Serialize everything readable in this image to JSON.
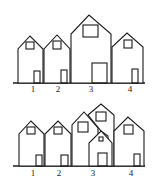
{
  "diagrams": [
    {
      "name": "top-row",
      "labels": [
        "1",
        "2",
        "3",
        "4"
      ]
    },
    {
      "name": "bottom-row",
      "labels": [
        "1",
        "2",
        "3",
        "4"
      ]
    }
  ],
  "colors": {
    "line": "#1a1a1a",
    "background": "#ffffff"
  }
}
